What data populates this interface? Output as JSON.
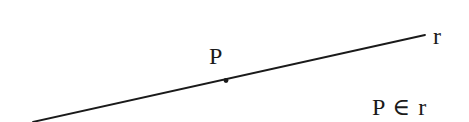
{
  "diagram": {
    "line": {
      "name": "r",
      "x1": 33,
      "y1": 122,
      "x2": 425,
      "y2": 35,
      "color": "#1a1a1a",
      "stroke_width": 1.8
    },
    "point": {
      "name": "P",
      "cx": 226,
      "cy": 80.5,
      "r": 2.4,
      "color": "#1a1a1a"
    },
    "labels": {
      "point_label": "P",
      "line_label": "r",
      "relation": "P ∈ r"
    }
  }
}
